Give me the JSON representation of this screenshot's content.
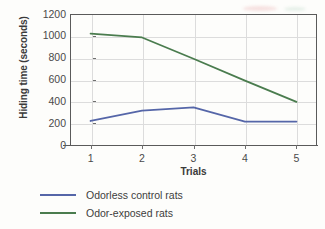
{
  "chart_data": {
    "type": "line",
    "title": "",
    "xlabel": "Trials",
    "ylabel": "Hiding time (seconds)",
    "x": [
      1,
      2,
      3,
      4,
      5
    ],
    "xtick_labels": [
      "1",
      "2",
      "3",
      "4",
      "5"
    ],
    "ytick_labels": [
      "0",
      "200",
      "400",
      "600",
      "800",
      "1000",
      "1200"
    ],
    "ytick_values": [
      0,
      200,
      400,
      600,
      800,
      1000,
      1200
    ],
    "ylim": [
      0,
      1200
    ],
    "xlim": [
      0.6,
      5.4
    ],
    "grid": "both",
    "legend_position": "below",
    "series": [
      {
        "name": "Odorless control rats",
        "color": "#5566a8",
        "values": [
          220,
          315,
          345,
          215,
          215
        ]
      },
      {
        "name": "Odor-exposed rats",
        "color": "#4a7c4e",
        "values": [
          1020,
          985,
          790,
          590,
          395
        ]
      }
    ]
  },
  "axis": {
    "y_title": "Hiding time (seconds)",
    "x_title": "Trials"
  },
  "legend": {
    "items": [
      {
        "label": "Odorless control rats",
        "color": "#5566a8"
      },
      {
        "label": "Odor-exposed rats",
        "color": "#4a7c4e"
      }
    ]
  }
}
